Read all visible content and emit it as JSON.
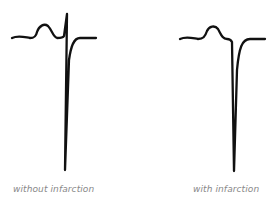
{
  "figure": {
    "panels": [
      {
        "id": "without",
        "label": "without infarction",
        "description": "ECG complex with small R wave followed by deep S wave"
      },
      {
        "id": "with",
        "label": "with infarction",
        "description": "ECG complex with deep pathological Q wave (QS complex), no R wave"
      }
    ],
    "colors": {
      "trace": "#111111",
      "label": "#888888",
      "background": "#ffffff"
    }
  }
}
